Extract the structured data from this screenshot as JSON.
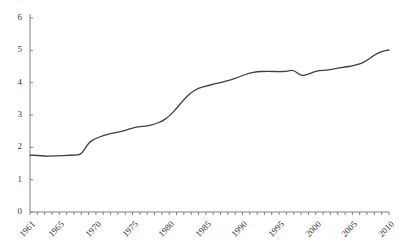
{
  "chart_data": {
    "type": "line",
    "title": "",
    "title_clipped": true,
    "xlabel": "",
    "ylabel": "",
    "xlim": [
      1961,
      2010
    ],
    "ylim": [
      0,
      6
    ],
    "yticks": [
      0,
      1,
      2,
      3,
      4,
      5,
      6
    ],
    "xtick_labels": [
      "1961",
      "1965",
      "1970",
      "1975",
      "1980",
      "1985",
      "1990",
      "1995",
      "2000",
      "2005",
      "2010"
    ],
    "xtick_label_years": [
      1961,
      1965,
      1970,
      1975,
      1980,
      1985,
      1990,
      1995,
      2000,
      2005,
      2010
    ],
    "minor_xticks_every": 1,
    "grid": false,
    "legend": false,
    "line_color": "#404040",
    "axis_color": "#808080",
    "series": [
      {
        "name": "series-1",
        "x": [
          1961,
          1962,
          1963,
          1964,
          1965,
          1966,
          1967,
          1968,
          1969,
          1970,
          1971,
          1972,
          1973,
          1974,
          1975,
          1976,
          1977,
          1978,
          1979,
          1980,
          1981,
          1982,
          1983,
          1984,
          1985,
          1986,
          1987,
          1988,
          1989,
          1990,
          1991,
          1992,
          1993,
          1994,
          1995,
          1996,
          1997,
          1998,
          1999,
          2000,
          2001,
          2002,
          2003,
          2004,
          2005,
          2006,
          2007,
          2008,
          2009,
          2010
        ],
        "values": [
          1.76,
          1.75,
          1.73,
          1.73,
          1.74,
          1.75,
          1.76,
          1.77,
          2.15,
          2.28,
          2.36,
          2.42,
          2.47,
          2.52,
          2.6,
          2.65,
          2.65,
          2.72,
          2.8,
          2.96,
          3.2,
          3.48,
          3.7,
          3.83,
          3.89,
          3.95,
          4.0,
          4.06,
          4.13,
          4.22,
          4.3,
          4.34,
          4.35,
          4.35,
          4.34,
          4.35,
          4.4,
          4.2,
          4.26,
          4.36,
          4.38,
          4.4,
          4.45,
          4.48,
          4.52,
          4.58,
          4.68,
          4.86,
          4.97,
          5.01
        ]
      }
    ]
  },
  "axes": {
    "y_tick_0": "0",
    "y_tick_1": "1",
    "y_tick_2": "2",
    "y_tick_3": "3",
    "y_tick_4": "4",
    "y_tick_5": "5",
    "y_tick_6": "6"
  }
}
